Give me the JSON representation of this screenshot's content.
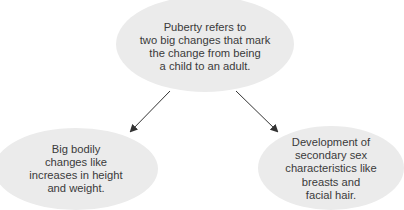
{
  "diagram": {
    "type": "concept-map",
    "colors": {
      "node_fill": "#ebebeb",
      "text": "#3a3a3a",
      "arrow": "#333333",
      "background": "#ffffff"
    },
    "nodes": [
      {
        "id": "puberty",
        "lines": [
          "Puberty refers to",
          "two big changes that mark",
          "the change from being",
          "a child to an adult."
        ]
      },
      {
        "id": "bodily-changes",
        "lines": [
          "Big bodily",
          "changes like",
          "increases in height",
          "and weight."
        ]
      },
      {
        "id": "secondary-sex",
        "lines": [
          "Development of",
          "secondary sex",
          "characteristics like",
          "breasts and",
          "facial hair."
        ]
      }
    ],
    "edges": [
      {
        "from": "puberty",
        "to": "bodily-changes"
      },
      {
        "from": "puberty",
        "to": "secondary-sex"
      }
    ]
  }
}
